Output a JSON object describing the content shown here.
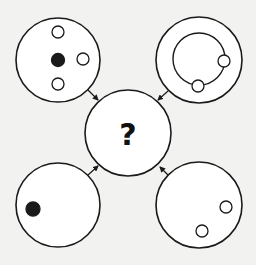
{
  "puzzle": {
    "question_mark": "?",
    "stroke_color": "#1a1a1a",
    "fill_color": "#ffffff",
    "center": {
      "cx": 128,
      "cy": 133,
      "r": 43,
      "label": "?"
    },
    "panels": [
      {
        "id": "top-left",
        "cx": 58,
        "cy": 60,
        "r": 42,
        "dots": [
          {
            "cx": 58,
            "cy": 32,
            "r": 6,
            "filled": false
          },
          {
            "cx": 58,
            "cy": 60,
            "r": 6.5,
            "filled": true
          },
          {
            "cx": 83,
            "cy": 59,
            "r": 6,
            "filled": false
          },
          {
            "cx": 58,
            "cy": 84,
            "r": 6,
            "filled": false
          }
        ],
        "inner_rings": [],
        "arrow": {
          "x1": 88,
          "y1": 90,
          "x2": 98,
          "y2": 100
        }
      },
      {
        "id": "top-right",
        "cx": 199,
        "cy": 60,
        "r": 43,
        "dots": [
          {
            "cx": 224,
            "cy": 61,
            "r": 6,
            "filled": false
          },
          {
            "cx": 198,
            "cy": 86,
            "r": 6,
            "filled": false
          }
        ],
        "inner_rings": [
          {
            "cx": 199,
            "cy": 59,
            "r": 26
          }
        ],
        "arrow": {
          "x1": 168,
          "y1": 91,
          "x2": 158,
          "y2": 100
        }
      },
      {
        "id": "bottom-left",
        "cx": 58,
        "cy": 205,
        "r": 42,
        "dots": [
          {
            "cx": 33,
            "cy": 209,
            "r": 7,
            "filled": true
          }
        ],
        "inner_rings": [],
        "arrow": {
          "x1": 88,
          "y1": 175,
          "x2": 98,
          "y2": 166
        }
      },
      {
        "id": "bottom-right",
        "cx": 199,
        "cy": 205,
        "r": 43,
        "dots": [
          {
            "cx": 226,
            "cy": 207,
            "r": 6,
            "filled": false
          },
          {
            "cx": 202,
            "cy": 231,
            "r": 6,
            "filled": false
          }
        ],
        "inner_rings": [],
        "arrow": {
          "x1": 168,
          "y1": 175,
          "x2": 160,
          "y2": 167
        }
      }
    ]
  }
}
